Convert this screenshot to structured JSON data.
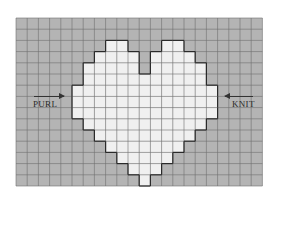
{
  "chart_data": {
    "type": "heatmap",
    "title": "",
    "grid": {
      "cols": 22,
      "rows": 15,
      "cell_px": 11.2,
      "origin": [
        16,
        18
      ]
    },
    "colors": {
      "background": "#b4b4b4",
      "motif": "#f0f0f0",
      "grid_line": "#6e6e6e",
      "outline": "#2a2a2a"
    },
    "motif_rows": [
      {
        "row": 2,
        "cols": [
          [
            8,
            9
          ],
          [
            13,
            14
          ]
        ]
      },
      {
        "row": 3,
        "cols": [
          [
            7,
            10
          ],
          [
            12,
            15
          ]
        ]
      },
      {
        "row": 4,
        "cols": [
          [
            6,
            10
          ],
          [
            12,
            16
          ]
        ]
      },
      {
        "row": 5,
        "cols": [
          [
            6,
            16
          ]
        ]
      },
      {
        "row": 6,
        "cols": [
          [
            5,
            17
          ]
        ]
      },
      {
        "row": 7,
        "cols": [
          [
            5,
            17
          ]
        ]
      },
      {
        "row": 8,
        "cols": [
          [
            5,
            17
          ]
        ]
      },
      {
        "row": 9,
        "cols": [
          [
            6,
            16
          ]
        ]
      },
      {
        "row": 10,
        "cols": [
          [
            7,
            15
          ]
        ]
      },
      {
        "row": 11,
        "cols": [
          [
            8,
            14
          ]
        ]
      },
      {
        "row": 12,
        "cols": [
          [
            9,
            13
          ]
        ]
      },
      {
        "row": 13,
        "cols": [
          [
            10,
            12
          ]
        ]
      },
      {
        "row": 14,
        "cols": [
          [
            11,
            11
          ]
        ]
      }
    ],
    "annotations": [
      {
        "text": "PURL",
        "arrow": "right",
        "side": "left"
      },
      {
        "text": "KNIT",
        "arrow": "left",
        "side": "right"
      }
    ]
  },
  "labels": {
    "purl": "PURL",
    "knit": "KNIT"
  }
}
